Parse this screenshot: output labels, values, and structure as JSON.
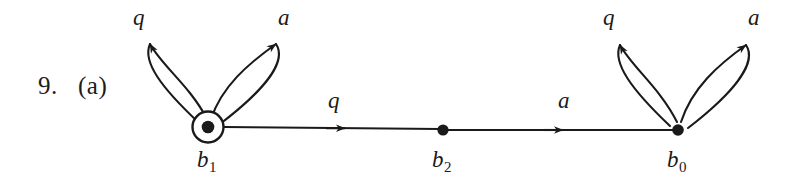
{
  "figure": {
    "item_number": "9.",
    "part_letter": "(a)",
    "background_color": "#ffffff",
    "stroke_color": "#1a1a1a"
  },
  "diagram": {
    "type": "state-transition-diagram",
    "nodes": [
      {
        "id": "b1",
        "label_base": "b",
        "label_sub": "1",
        "x": 208,
        "y": 127,
        "accepting": true,
        "style": "dot-in-circle"
      },
      {
        "id": "b2",
        "label_base": "b",
        "label_sub": "2",
        "x": 443,
        "y": 130,
        "accepting": false,
        "style": "dot"
      },
      {
        "id": "b0",
        "label_base": "b",
        "label_sub": "0",
        "x": 678,
        "y": 130,
        "accepting": false,
        "style": "dot"
      }
    ],
    "edges": [
      {
        "id": "e-b2-b1",
        "from": "b2",
        "to": "b1",
        "label": "q",
        "label_x": 328,
        "label_y": 88,
        "direction": "left"
      },
      {
        "id": "e-b2-b0",
        "from": "b2",
        "to": "b0",
        "label": "a",
        "label_x": 558,
        "label_y": 88,
        "direction": "right"
      }
    ],
    "self_loops": [
      {
        "id": "loop-b1-q",
        "node": "b1",
        "label": "q",
        "label_x": 133,
        "label_y": 5,
        "side": "left"
      },
      {
        "id": "loop-b1-a",
        "node": "b1",
        "label": "a",
        "label_x": 278,
        "label_y": 5,
        "side": "right"
      },
      {
        "id": "loop-b0-q",
        "node": "b0",
        "label": "q",
        "label_x": 603,
        "label_y": 5,
        "side": "left"
      },
      {
        "id": "loop-b0-a",
        "node": "b0",
        "label": "a",
        "label_x": 748,
        "label_y": 5,
        "side": "right"
      }
    ]
  }
}
